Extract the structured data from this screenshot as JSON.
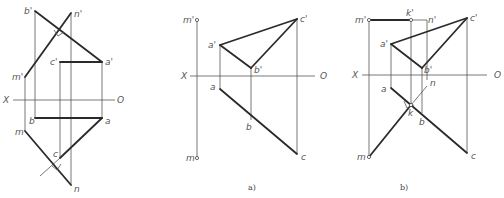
{
  "figure": {
    "panels": [
      {
        "id": "given",
        "caption": "",
        "axis": {
          "x_label": "X",
          "o_label": "O"
        },
        "labels": {
          "b_prime": "b'",
          "n_prime": "n'",
          "a_prime": "a'",
          "c_prime": "c'",
          "m_prime": "m'",
          "b": "b",
          "a": "a",
          "m": "m",
          "c": "c",
          "n": "n"
        }
      },
      {
        "id": "a",
        "caption": "a)",
        "axis": {
          "x_label": "X",
          "o_label": "O"
        },
        "labels": {
          "m_prime": "m'",
          "c_prime": "c'",
          "a_prime": "a'",
          "b_prime": "b'",
          "a": "a",
          "b": "b",
          "c": "c",
          "m": "m"
        }
      },
      {
        "id": "b",
        "caption": "b)",
        "axis": {
          "x_label": "X",
          "o_label": "O"
        },
        "labels": {
          "m_prime": "m'",
          "k_prime": "k'",
          "n_prime": "n'",
          "c_prime": "c'",
          "a_prime": "a'",
          "b_prime": "b'",
          "a": "a",
          "n": "n",
          "k": "k",
          "b": "b",
          "m": "m",
          "c": "c"
        }
      }
    ]
  }
}
